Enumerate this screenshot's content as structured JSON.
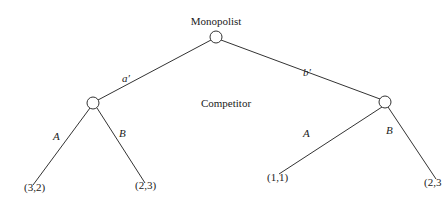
{
  "diagram": {
    "type": "extensive-form game tree",
    "players": {
      "root": "Monopolist",
      "second": "Competitor"
    },
    "root_actions": [
      "a′",
      "b′"
    ],
    "competitor_actions": [
      "A",
      "B"
    ],
    "branches": [
      {
        "monopolist_action": "a′",
        "outcomes": [
          {
            "competitor_action": "A",
            "payoff": "(3,2)"
          },
          {
            "competitor_action": "B",
            "payoff": "(2,3)"
          }
        ]
      },
      {
        "monopolist_action": "b′",
        "outcomes": [
          {
            "competitor_action": "A",
            "payoff": "(1,1)"
          },
          {
            "competitor_action": "B",
            "payoff": "(2,3"
          }
        ]
      }
    ]
  },
  "labels": {
    "monopolist": "Monopolist",
    "competitor": "Competitor",
    "a_prime": "a′",
    "b_prime": "b′",
    "left_A": "A",
    "left_B": "B",
    "right_A": "A",
    "right_B": "B",
    "payoff_LA": "(3,2)",
    "payoff_LB": "(2,3)",
    "payoff_RA": "(1,1)",
    "payoff_RB": "(2,3"
  }
}
